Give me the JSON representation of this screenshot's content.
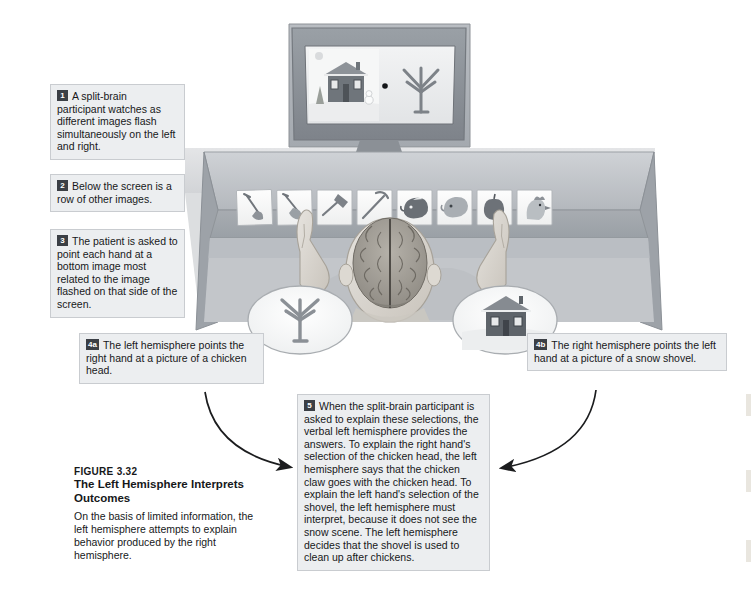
{
  "figure": {
    "number": "FIGURE 3.32",
    "title": "The Left Hemisphere Interprets Outcomes",
    "body": "On the basis of limited information, the left hemisphere attempts to explain behavior produced by the right hemisphere."
  },
  "callouts": [
    {
      "id": "1",
      "badge": "1",
      "text": "A split-brain participant watches as different images flash simultaneously on the left and right."
    },
    {
      "id": "2",
      "badge": "2",
      "text": "Below the screen is a row of other images."
    },
    {
      "id": "3",
      "badge": "3",
      "text": "The patient is asked to point each hand at a bottom image most related to the image flashed on that side of the screen."
    },
    {
      "id": "4a",
      "badge": "4a",
      "text": "The left hemisphere points the right hand at a picture of a chicken head."
    },
    {
      "id": "4b",
      "badge": "4b",
      "text": "The right hemisphere points the left hand at a picture of a snow shovel."
    },
    {
      "id": "5",
      "badge": "5",
      "text": "When the split-brain participant is asked to explain these selections, the verbal left hemisphere provides the answers. To explain the right hand's selection of the chicken head, the left hemisphere says that the chicken claw goes with the chicken head. To explain the left hand's selection of the shovel, the left hemisphere must interpret, because it does not see the snow scene. The left hemisphere decides that the shovel is used to clean up after chickens."
    }
  ],
  "illustration": {
    "monitor": {
      "name": "display-monitor",
      "left_image": "snow-scene-house",
      "right_image": "chicken-claw",
      "fixation_dot": "center-fixation-dot"
    },
    "image_cards": [
      "snow-shovel",
      "snow-shovel-flat",
      "hammer",
      "pickaxe",
      "cow",
      "lamb",
      "apple",
      "chicken-head"
    ],
    "participant": {
      "name": "split-brain-participant",
      "brain": "brain-top-view",
      "left_hand": "left-hand-pointing",
      "right_hand": "right-hand-pointing"
    },
    "insets": [
      {
        "name": "left-hemisphere-view-inset",
        "content": "chicken-claw"
      },
      {
        "name": "right-hemisphere-view-inset",
        "content": "snow-scene-house"
      }
    ],
    "arrows": [
      {
        "name": "arrow-left-to-explanation"
      },
      {
        "name": "arrow-right-to-explanation"
      }
    ]
  },
  "colors": {
    "callout_bg": "#eceef0",
    "callout_border": "#c9ccd0",
    "badge_bg": "#3b3f45",
    "text": "#17181a",
    "desk": "#b9bcc0",
    "monitor_frame": "#8d9196",
    "arrow": "#1b1c1e"
  }
}
